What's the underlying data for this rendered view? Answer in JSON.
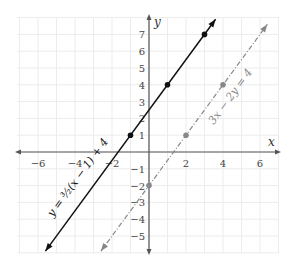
{
  "chart_data": {
    "type": "line",
    "title": "",
    "xlabel": "x",
    "ylabel": "y",
    "xlim": [
      -7,
      7
    ],
    "ylim": [
      -6,
      8
    ],
    "grid": true,
    "x_ticks": [
      -6,
      -4,
      -2,
      2,
      4,
      6
    ],
    "y_ticks": [
      -5,
      -4,
      -3,
      -2,
      -1,
      1,
      2,
      3,
      4,
      5,
      6,
      7
    ],
    "series": [
      {
        "name": "y = (3/2)(x − 1) + 4",
        "label": "y = ³⁄₂(x − 1) + 4",
        "style": "solid",
        "color": "#111111",
        "slope": 1.5,
        "points": [
          [
            -1,
            1
          ],
          [
            1,
            4
          ],
          [
            3,
            7
          ]
        ],
        "x_range": [
          -5.6,
          3.6
        ]
      },
      {
        "name": "3x − 2y = 4",
        "label": "3x − 2y = 4",
        "style": "dash-dot",
        "color": "#888888",
        "slope": 1.5,
        "points": [
          [
            0,
            -2
          ],
          [
            2,
            1
          ],
          [
            4,
            4
          ]
        ],
        "x_range": [
          -2.6,
          6.4
        ]
      }
    ]
  },
  "labels": {
    "x_axis": "x",
    "y_axis": "y",
    "line1": "y = ³⁄₂(x − 1) + 4",
    "line2": "3x − 2y = 4"
  }
}
